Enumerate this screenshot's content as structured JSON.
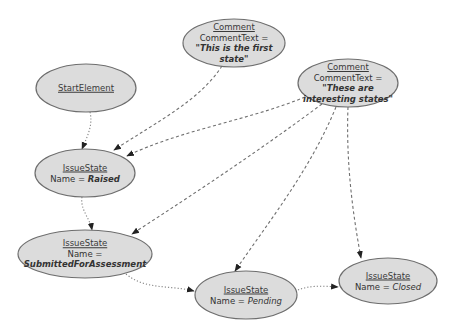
{
  "diagram": {
    "type": "object-diagram",
    "nodes": [
      {
        "id": "start",
        "type_name": "StartElement",
        "cx": 86,
        "cy": 88,
        "rx": 50,
        "ry": 24
      },
      {
        "id": "comment1",
        "type_name": "Comment",
        "attr_label": "CommentText =",
        "attr_value_1": "\"This is the first",
        "attr_value_2": "state\"",
        "cx": 234,
        "cy": 43,
        "rx": 51,
        "ry": 24
      },
      {
        "id": "comment2",
        "type_name": "Comment",
        "attr_label": "CommentText =",
        "attr_value_1": "\"These are",
        "attr_value_2": "interesting states\"",
        "cx": 348,
        "cy": 83,
        "rx": 50,
        "ry": 24
      },
      {
        "id": "raised",
        "type_name": "IssueState",
        "attr_label": "Name = ",
        "attr_value": "Raised",
        "cx": 85,
        "cy": 173,
        "rx": 50,
        "ry": 24
      },
      {
        "id": "submitted",
        "type_name": "IssueState",
        "attr_label": "Name =",
        "attr_value": "SubmittedForAssessment",
        "cx": 85,
        "cy": 254,
        "rx": 67,
        "ry": 24
      },
      {
        "id": "pending",
        "type_name": "IssueState",
        "attr_label": "Name = ",
        "attr_value": "Pending",
        "cx": 246,
        "cy": 295,
        "rx": 51,
        "ry": 24
      },
      {
        "id": "closed",
        "type_name": "IssueState",
        "attr_label": "Name = ",
        "attr_value": "Closed",
        "cx": 388,
        "cy": 281,
        "rx": 49,
        "ry": 23
      }
    ],
    "edges": [
      {
        "from": "start",
        "to": "raised",
        "style": "dotted"
      },
      {
        "from": "raised",
        "to": "submitted",
        "style": "dotted"
      },
      {
        "from": "submitted",
        "to": "pending",
        "style": "dotted"
      },
      {
        "from": "pending",
        "to": "closed",
        "style": "dotted"
      },
      {
        "from": "comment1",
        "to": "raised",
        "style": "dashed"
      },
      {
        "from": "comment2",
        "to": "raised",
        "style": "dashed"
      },
      {
        "from": "comment2",
        "to": "submitted",
        "style": "dashed"
      },
      {
        "from": "comment2",
        "to": "pending",
        "style": "dashed"
      },
      {
        "from": "comment2",
        "to": "closed",
        "style": "dashed"
      }
    ],
    "colors": {
      "node_fill": "#dcdcdc",
      "node_stroke": "#6e6e6e",
      "edge": "#707070",
      "background": "#ffffff"
    }
  }
}
